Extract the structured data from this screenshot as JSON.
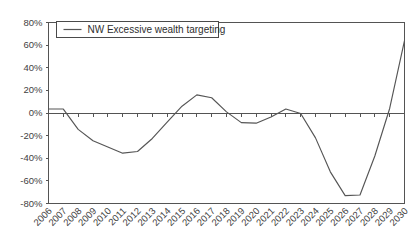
{
  "chart_data": {
    "type": "line",
    "title": "",
    "xlabel": "",
    "ylabel": "",
    "ylim": [
      -80,
      80
    ],
    "ytick_values": [
      80,
      60,
      40,
      20,
      0,
      -20,
      -40,
      -60,
      -80
    ],
    "ytick_labels": [
      "80%",
      "60%",
      "40%",
      "20%",
      "0%",
      "-20%",
      "-40%",
      "-60%",
      "-80%"
    ],
    "grid": false,
    "legend_position": "top-left",
    "legend_entries": [
      "NW Excessive wealth targeting"
    ],
    "categories": [
      "2006",
      "2007",
      "2008",
      "2009",
      "2010",
      "2011",
      "2012",
      "2013",
      "2014",
      "2015",
      "2016",
      "2017",
      "2018",
      "2019",
      "2020",
      "2021",
      "2022",
      "2023",
      "2024",
      "2025",
      "2026",
      "2027",
      "2028",
      "2029",
      "2030"
    ],
    "series": [
      {
        "name": "NW Excessive wealth targeting",
        "color": "#555555",
        "values": [
          3.5,
          3.5,
          -14.5,
          -24.5,
          -30.0,
          -35.5,
          -34.0,
          -22.5,
          -8.0,
          6.0,
          16.0,
          13.5,
          1.0,
          -8.5,
          -9.0,
          -3.5,
          3.5,
          -0.5,
          -22.0,
          -52.0,
          -73.0,
          -72.5,
          -38.0,
          4.0,
          64.0
        ]
      }
    ],
    "axis_color": "#545454",
    "zero_line_value": 0
  }
}
